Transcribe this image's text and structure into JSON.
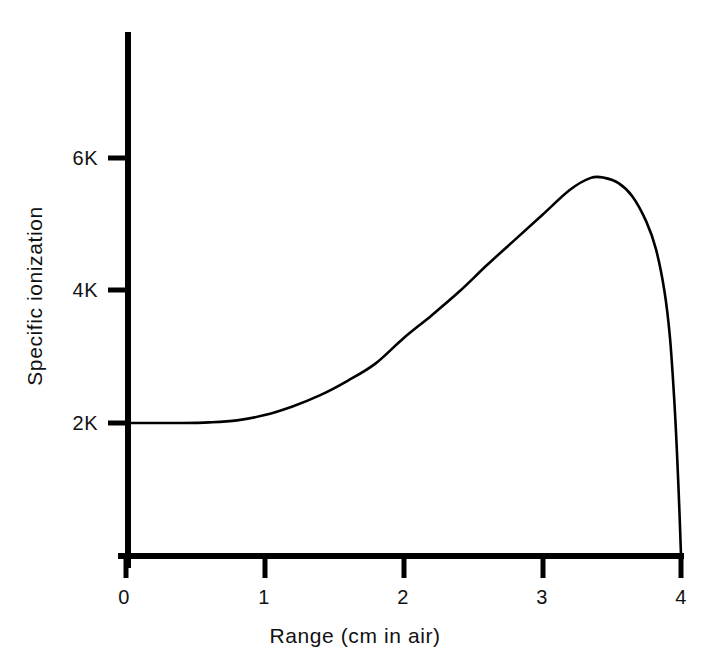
{
  "figure": {
    "background_color": "#ffffff",
    "line_color": "#000000",
    "axis_color": "#000000"
  },
  "axes": {
    "x_title": "Range (cm in air)",
    "y_title": "Specific ionization",
    "x_ticks": [
      "0",
      "1",
      "2",
      "3",
      "4"
    ],
    "y_ticks": [
      "2K",
      "4K",
      "6K"
    ]
  },
  "chart_data": {
    "type": "line",
    "title": "",
    "subtitle": "",
    "xlabel": "Range (cm in air)",
    "ylabel": "Specific ionization",
    "xlim": [
      0,
      4
    ],
    "ylim": [
      0,
      7000
    ],
    "xticks": [
      0,
      1,
      2,
      3,
      4
    ],
    "xticklabels": [
      "0",
      "1",
      "2",
      "3",
      "4"
    ],
    "yticks": [
      2000,
      4000,
      6000
    ],
    "yticklabels": [
      "2K",
      "4K",
      "6K"
    ],
    "grid": false,
    "legend": false,
    "legend_position": "none",
    "series": [
      {
        "name": "Bragg curve",
        "x": [
          0.0,
          0.2,
          0.4,
          0.6,
          0.8,
          1.0,
          1.2,
          1.4,
          1.6,
          1.8,
          2.0,
          2.2,
          2.4,
          2.6,
          2.8,
          3.0,
          3.2,
          3.35,
          3.45,
          3.55,
          3.65,
          3.75,
          3.82,
          3.88,
          3.92,
          3.95,
          3.97,
          3.99,
          4.0
        ],
        "y": [
          2000,
          2000,
          2000,
          2010,
          2040,
          2120,
          2250,
          2420,
          2640,
          2900,
          3280,
          3620,
          3980,
          4380,
          4760,
          5140,
          5520,
          5700,
          5700,
          5620,
          5420,
          5040,
          4620,
          4000,
          3300,
          2400,
          1600,
          600,
          0
        ]
      }
    ],
    "annotations": [
      {
        "text": "peak (Bragg peak)",
        "x": 3.4,
        "y": 5700
      }
    ]
  },
  "geometry": {
    "plot_left_px": 126,
    "plot_right_px": 681,
    "plot_top_px": 32,
    "plot_baseline_px": 556,
    "y_2k_px": 423,
    "y_4k_px": 290,
    "y_6k_px": 158
  }
}
